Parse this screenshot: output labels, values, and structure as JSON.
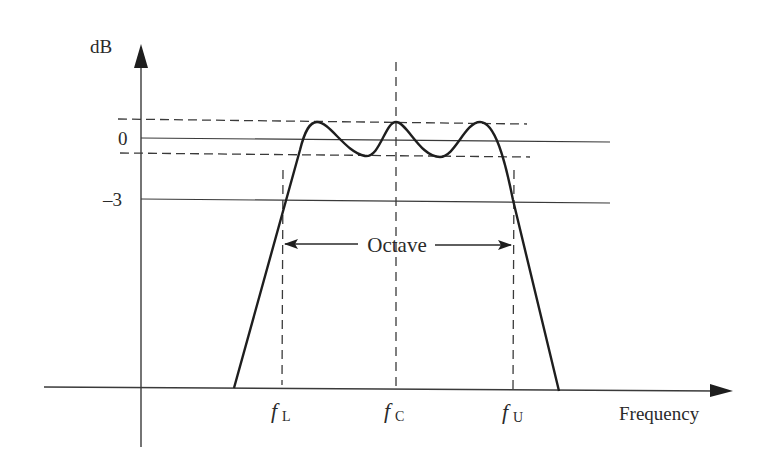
{
  "diagram": {
    "y_axis": {
      "label": "dB"
    },
    "x_axis": {
      "label": "Frequency"
    },
    "levels": [
      {
        "label": "0",
        "value_db": 0
      },
      {
        "label": "–3",
        "value_db": -3
      }
    ],
    "ripple_band": {
      "style": "dashed",
      "description": "upper and lower ripple limits around 0 dB"
    },
    "frequency_marks": [
      {
        "base": "f",
        "sub": "L",
        "name": "lower cutoff"
      },
      {
        "base": "f",
        "sub": "C",
        "name": "center frequency"
      },
      {
        "base": "f",
        "sub": "U",
        "name": "upper cutoff"
      }
    ],
    "bandwidth_annotation": {
      "label": "Octave"
    },
    "colors": {
      "ink": "#2a2a2a",
      "background": "#ffffff"
    }
  }
}
